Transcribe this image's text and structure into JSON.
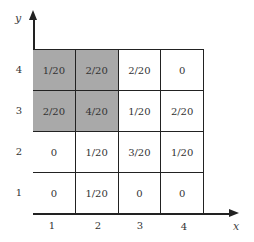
{
  "axes": {
    "x_label": "x",
    "y_label": "y"
  },
  "x_ticks": [
    "1",
    "2",
    "3",
    "4"
  ],
  "y_ticks": [
    "4",
    "3",
    "2",
    "1"
  ],
  "shade_color": "#a9a9a9",
  "grid": {
    "rows": [
      {
        "y": "4",
        "cells": [
          {
            "value": "1/20",
            "shaded": true
          },
          {
            "value": "2/20",
            "shaded": true
          },
          {
            "value": "2/20",
            "shaded": false
          },
          {
            "value": "0",
            "shaded": false
          }
        ]
      },
      {
        "y": "3",
        "cells": [
          {
            "value": "2/20",
            "shaded": true
          },
          {
            "value": "4/20",
            "shaded": true
          },
          {
            "value": "1/20",
            "shaded": false
          },
          {
            "value": "2/20",
            "shaded": false
          }
        ]
      },
      {
        "y": "2",
        "cells": [
          {
            "value": "0",
            "shaded": false
          },
          {
            "value": "1/20",
            "shaded": false
          },
          {
            "value": "3/20",
            "shaded": false
          },
          {
            "value": "1/20",
            "shaded": false
          }
        ]
      },
      {
        "y": "1",
        "cells": [
          {
            "value": "0",
            "shaded": false
          },
          {
            "value": "1/20",
            "shaded": false
          },
          {
            "value": "0",
            "shaded": false
          },
          {
            "value": "0",
            "shaded": false
          }
        ]
      }
    ]
  }
}
